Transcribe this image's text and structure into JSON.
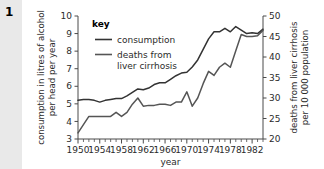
{
  "figure": {
    "number": "1",
    "background_color": "#e9e9e9",
    "paper_color": "#ffffff"
  },
  "chart_data": {
    "type": "line",
    "title": "",
    "xlabel": "year",
    "grid": false,
    "legend": {
      "title": "key",
      "position": "top-left-inside",
      "entries": [
        {
          "label": "consumption",
          "color": "#333333"
        },
        {
          "label": "deaths from liver cirrhosis",
          "label_line1": "deaths from",
          "label_line2": "liver cirrhosis",
          "color": "#555555"
        }
      ]
    },
    "x": [
      1950,
      1951,
      1952,
      1953,
      1954,
      1955,
      1956,
      1957,
      1958,
      1959,
      1960,
      1961,
      1962,
      1963,
      1964,
      1965,
      1966,
      1967,
      1968,
      1969,
      1970,
      1971,
      1972,
      1973,
      1974,
      1975,
      1976,
      1977,
      1978,
      1979,
      1980,
      1981,
      1982,
      1983,
      1984
    ],
    "xlim": [
      1950,
      1984
    ],
    "xticks": [
      1950,
      1954,
      1958,
      1962,
      1966,
      1970,
      1974,
      1978,
      1982
    ],
    "xtick_labels": [
      "1950",
      "1954",
      "1958",
      "1962",
      "1966",
      "1970",
      "1974",
      "1978",
      "1982"
    ],
    "xminor_step": 1,
    "axes": [
      {
        "side": "left",
        "ylabel": "consumption in litres of alcohol per head per year",
        "ylabel_line1": "consumption in litres of alcohol",
        "ylabel_line2": "per head per year",
        "ylim": [
          3,
          10
        ],
        "yticks": [
          3,
          4,
          5,
          6,
          7,
          8,
          9,
          10
        ],
        "ytick_labels": [
          "3",
          "4",
          "5",
          "6",
          "7",
          "8",
          "9",
          "10"
        ]
      },
      {
        "side": "right",
        "ylabel": "deaths from liver cirrhosis per 10 000 population",
        "ylabel_line1": "deaths from liver cirrhosis",
        "ylabel_line2": "per 10 000 population",
        "ylim": [
          20,
          50
        ],
        "yticks": [
          20,
          25,
          30,
          35,
          40,
          45,
          50
        ],
        "ytick_labels": [
          "20",
          "25",
          "30",
          "35",
          "40",
          "45",
          "50"
        ]
      }
    ],
    "series": [
      {
        "name": "consumption",
        "axis": "left",
        "unit": "litres of alcohol per head per year",
        "color": "#333333",
        "values": [
          5.2,
          5.25,
          5.25,
          5.2,
          5.1,
          5.2,
          5.25,
          5.3,
          5.3,
          5.45,
          5.65,
          5.85,
          5.8,
          5.9,
          6.1,
          6.2,
          6.2,
          6.4,
          6.6,
          6.75,
          6.8,
          7.1,
          7.5,
          8.1,
          8.7,
          9.1,
          9.1,
          9.3,
          9.1,
          9.4,
          9.2,
          9.0,
          9.05,
          9.0,
          9.25
        ]
      },
      {
        "name": "deaths from liver cirrhosis",
        "axis": "right",
        "unit": "deaths per 10 000 population",
        "color": "#555555",
        "values": [
          21.5,
          23.5,
          25.5,
          25.5,
          25.5,
          25.5,
          25.5,
          26.5,
          25.5,
          26.5,
          28.5,
          30.0,
          28.0,
          28.2,
          28.2,
          28.5,
          28.5,
          28.2,
          29.0,
          29.0,
          31.5,
          28.0,
          30.0,
          33.5,
          36.5,
          35.5,
          37.5,
          38.5,
          37.5,
          41.5,
          45.5,
          45.0,
          45.0,
          45.2,
          46.5
        ]
      }
    ]
  }
}
